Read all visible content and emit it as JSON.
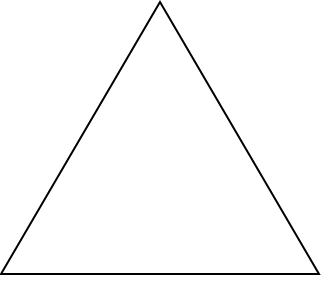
{
  "diagram": {
    "shape": "triangle",
    "stroke_color": "#000000",
    "fill_color": "none",
    "background_color": "#ffffff",
    "stroke_width": 2,
    "vertices": {
      "apex": [
        160,
        2
      ],
      "bottom_left": [
        1,
        274
      ],
      "bottom_right": [
        319,
        274
      ]
    }
  }
}
